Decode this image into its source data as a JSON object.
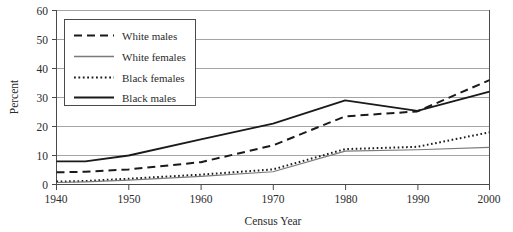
{
  "chart_data": {
    "type": "line",
    "title": "",
    "xlabel": "Census Year",
    "ylabel": "Percent",
    "xlim": [
      1940,
      2000
    ],
    "ylim": [
      0,
      60
    ],
    "xticks": [
      1940,
      1950,
      1960,
      1970,
      1980,
      1990,
      2000
    ],
    "yticks": [
      0,
      10,
      20,
      30,
      40,
      50,
      60
    ],
    "xtick_labels": [
      "1940",
      "1950",
      "1960",
      "1970",
      "1980",
      "1990",
      "2000"
    ],
    "ytick_labels": [
      "0",
      "10",
      "20",
      "30",
      "40",
      "50",
      "60"
    ],
    "grid": "horizontal",
    "legend_position": "upper-left-inside",
    "x": [
      1940,
      1944,
      1950,
      1960,
      1970,
      1980,
      1990,
      2000
    ],
    "series": [
      {
        "name": "White males",
        "style": "dashed",
        "color": "#1a1a1a",
        "width": 2.0,
        "values": [
          4.2,
          4.4,
          5.2,
          7.7,
          13.5,
          23.5,
          25.2,
          36.0
        ]
      },
      {
        "name": "White females",
        "style": "solid-thin",
        "color": "#7a7a7a",
        "width": 1.1,
        "values": [
          0.7,
          0.9,
          1.5,
          2.8,
          4.4,
          11.5,
          12.0,
          12.8
        ]
      },
      {
        "name": "Black females",
        "style": "dotted",
        "color": "#1a1a1a",
        "width": 2.0,
        "values": [
          1.0,
          1.2,
          2.0,
          3.4,
          5.2,
          12.2,
          13.0,
          18.0
        ]
      },
      {
        "name": "Black males",
        "style": "solid-thick",
        "color": "#1a1a1a",
        "width": 1.8,
        "values": [
          8.0,
          8.0,
          10.0,
          15.6,
          21.0,
          29.0,
          25.4,
          32.0
        ]
      }
    ]
  },
  "legend": {
    "entries": [
      {
        "label": "White males",
        "style": "dashed"
      },
      {
        "label": "White females",
        "style": "solid-thin"
      },
      {
        "label": "Black females",
        "style": "dotted"
      },
      {
        "label": "Black males",
        "style": "solid-thick"
      }
    ]
  },
  "colors": {
    "ink": "#1a1a1a",
    "grid": "#9a9a9a",
    "frame": "#4a4a4a",
    "light_series": "#7a7a7a",
    "background": "#ffffff"
  }
}
